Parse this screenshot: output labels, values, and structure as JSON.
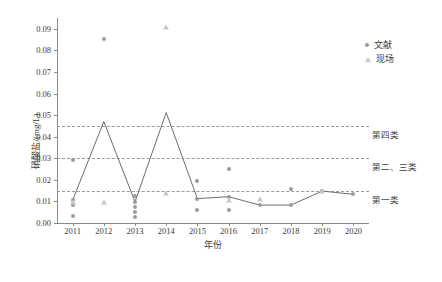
{
  "chart_data": {
    "type": "line",
    "title": "",
    "xlabel": "年份",
    "ylabel": "硝酸盐/(mg/L)",
    "xlim": [
      2010.5,
      2020.5
    ],
    "ylim": [
      0.0,
      0.095
    ],
    "yticks": [
      "0.00",
      "0.01",
      "0.02",
      "0.03",
      "0.04",
      "0.05",
      "0.06",
      "0.07",
      "0.08",
      "0.09"
    ],
    "ytick_values": [
      0.0,
      0.01,
      0.02,
      0.03,
      0.04,
      0.05,
      0.06,
      0.07,
      0.08,
      0.09
    ],
    "categories": [
      "2011",
      "2012",
      "2013",
      "2014",
      "2015",
      "2016",
      "2017",
      "2018",
      "2019",
      "2020"
    ],
    "x": [
      2011,
      2012,
      2013,
      2014,
      2015,
      2016,
      2017,
      2018,
      2019,
      2020
    ],
    "grid": false,
    "legend_position": "top-right",
    "legend": [
      {
        "label": "文献",
        "marker": "circle",
        "color": "#9b9b9b"
      },
      {
        "label": "现场",
        "marker": "triangle",
        "color": "#c8c8c8"
      }
    ],
    "series": [
      {
        "name": "mean-line",
        "type": "line",
        "color": "#6e6e6e",
        "x": [
          2011,
          2012,
          2013,
          2014,
          2015,
          2016,
          2017,
          2018,
          2019,
          2020
        ],
        "values": [
          0.0105,
          0.047,
          0.0098,
          0.0512,
          0.0113,
          0.0122,
          0.0083,
          0.0083,
          0.0148,
          0.0133
        ]
      },
      {
        "name": "文献",
        "type": "scatter",
        "marker": "circle",
        "color": "#9b9b9b",
        "points": [
          {
            "x": 2011,
            "y": 0.0293
          },
          {
            "x": 2011,
            "y": 0.0105
          },
          {
            "x": 2011,
            "y": 0.0083
          },
          {
            "x": 2011,
            "y": 0.0033
          },
          {
            "x": 2012,
            "y": 0.0851
          },
          {
            "x": 2013,
            "y": 0.0123
          },
          {
            "x": 2013,
            "y": 0.0098
          },
          {
            "x": 2013,
            "y": 0.0073
          },
          {
            "x": 2013,
            "y": 0.005
          },
          {
            "x": 2013,
            "y": 0.003
          },
          {
            "x": 2015,
            "y": 0.0196
          },
          {
            "x": 2015,
            "y": 0.0113
          },
          {
            "x": 2015,
            "y": 0.006
          },
          {
            "x": 2016,
            "y": 0.0252
          },
          {
            "x": 2016,
            "y": 0.0122
          },
          {
            "x": 2016,
            "y": 0.006
          },
          {
            "x": 2017,
            "y": 0.0083
          },
          {
            "x": 2018,
            "y": 0.0158
          },
          {
            "x": 2018,
            "y": 0.0083
          },
          {
            "x": 2019,
            "y": 0.0148
          },
          {
            "x": 2020,
            "y": 0.0133
          }
        ]
      },
      {
        "name": "现场",
        "type": "scatter",
        "marker": "triangle",
        "color": "#c8c8c8",
        "points": [
          {
            "x": 2011,
            "y": 0.0098
          },
          {
            "x": 2012,
            "y": 0.0098
          },
          {
            "x": 2014,
            "y": 0.091
          },
          {
            "x": 2014,
            "y": 0.014
          },
          {
            "x": 2016,
            "y": 0.0105
          },
          {
            "x": 2017,
            "y": 0.0112
          },
          {
            "x": 2019,
            "y": 0.0148
          }
        ]
      }
    ],
    "thresholds": [
      {
        "label": "第四类",
        "value": 0.045,
        "style": "dashed",
        "color": "#9a9a9a"
      },
      {
        "label": "第二、三类",
        "value": 0.03,
        "style": "dashed",
        "color": "#9a9a9a"
      },
      {
        "label": "第一类",
        "value": 0.015,
        "style": "dashed",
        "color": "#9a9a9a"
      }
    ]
  }
}
